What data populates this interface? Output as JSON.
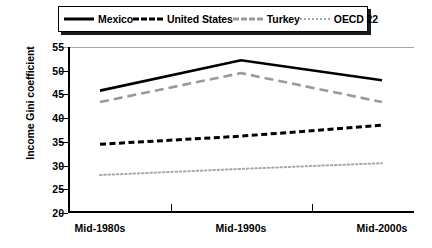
{
  "chart_data": {
    "type": "line",
    "title": "",
    "subtitle": "",
    "xlabel": "",
    "ylabel": "Income Gini coefficient",
    "categories": [
      "Mid-1980s",
      "Mid-1990s",
      "Mid-2000s"
    ],
    "ylim": [
      20,
      55
    ],
    "yticks": [
      20,
      25,
      30,
      35,
      40,
      45,
      50,
      55
    ],
    "grid": false,
    "legend_position": "top",
    "series": [
      {
        "name": "Mexico",
        "values": [
          45.8,
          52.2,
          48.0
        ],
        "style": "solid",
        "color": "#000000",
        "swatch": "sw-solid"
      },
      {
        "name": "United States",
        "values": [
          34.5,
          36.2,
          38.5
        ],
        "style": "dashed",
        "color": "#000000",
        "swatch": "sw-dashed"
      },
      {
        "name": "Turkey",
        "values": [
          43.4,
          49.5,
          43.4
        ],
        "style": "long-dash",
        "color": "#9a9a9a",
        "swatch": "sw-longdash"
      },
      {
        "name": "OECD 22",
        "values": [
          28.0,
          29.3,
          30.5
        ],
        "style": "dotted",
        "color": "#a8a8a8",
        "swatch": "sw-dotted"
      }
    ]
  },
  "legend": {
    "items": [
      {
        "label": "Mexico"
      },
      {
        "label": "United States"
      },
      {
        "label": "Turkey"
      },
      {
        "label": "OECD 22"
      }
    ]
  },
  "axes": {
    "y_title": "Income Gini coefficient",
    "y_tick_labels": [
      "55",
      "50",
      "45",
      "40",
      "35",
      "30",
      "25",
      "20"
    ],
    "x_tick_labels": [
      "Mid-1980s",
      "Mid-1990s",
      "Mid-2000s"
    ]
  },
  "colors": {
    "axis": "#000000",
    "frame": "#1a1a1a",
    "gray_series": "#9a9a9a",
    "light_gray_series": "#a8a8a8",
    "background": "#ffffff"
  }
}
